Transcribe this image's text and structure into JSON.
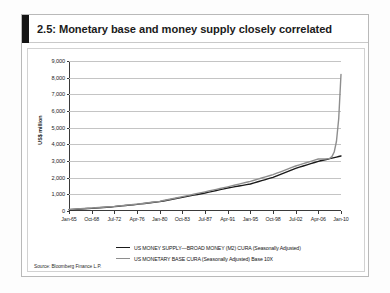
{
  "figure": {
    "number_and_title": "2.5: Monetary base and money supply closely correlated",
    "source_note": "Source: Bloomberg Finance L.P.",
    "accent_color": "#141414"
  },
  "chart_data": {
    "type": "line",
    "title": "2.5: Monetary base and money supply closely correlated",
    "xlabel": "",
    "ylabel": "US$ million",
    "ylim": [
      0,
      9000
    ],
    "ytick_step": 1000,
    "ytick_labels": [
      "0",
      "1,000",
      "2,000",
      "3,000",
      "4,000",
      "5,000",
      "6,000",
      "7,000",
      "8,000",
      "9,000"
    ],
    "grid": true,
    "legend_position": "bottom",
    "x_tick_labels": [
      "Jan-65",
      "Oct-68",
      "Jul-72",
      "Apr-76",
      "Jan-80",
      "Oct-83",
      "Jul-87",
      "Apr-91",
      "Jan-95",
      "Oct-98",
      "Jul-02",
      "Apr-06",
      "Jan-10"
    ],
    "series": [
      {
        "name": "US MONEY SUPPLY—BROAD MONEY (M2) CURA (Seasonally Adjusted)",
        "color": "#1a1a1a",
        "x": [
          "Jan-65",
          "Oct-68",
          "Jul-72",
          "Apr-76",
          "Jan-80",
          "Oct-83",
          "Jul-87",
          "Apr-91",
          "Jan-95",
          "Oct-98",
          "Jul-02",
          "Apr-06",
          "Jan-10"
        ],
        "values": [
          80,
          160,
          260,
          400,
          560,
          820,
          1080,
          1380,
          1620,
          2020,
          2560,
          2980,
          3300
        ]
      },
      {
        "name": "US MONETARY BASE CURA (Seasonally Adjusted) Base 10X",
        "color": "#8e8e8e",
        "x": [
          "Jan-65",
          "Oct-68",
          "Jul-72",
          "Apr-76",
          "Jan-80",
          "Oct-83",
          "Jul-87",
          "Apr-91",
          "Jan-95",
          "Oct-98",
          "Jul-02",
          "Apr-06",
          "Jan-10"
        ],
        "values": [
          95,
          175,
          275,
          410,
          580,
          860,
          1150,
          1450,
          1780,
          2180,
          2700,
          3120,
          8200
        ]
      }
    ],
    "annotations": [
      "Monetary base (10X) spikes from about 3,200 to about 8,200 after Apr-06"
    ]
  },
  "legend": {
    "entries": [
      {
        "label": "US MONEY SUPPLY—BROAD MONEY (M2) CURA (Seasonally Adjusted)",
        "color": "#1a1a1a"
      },
      {
        "label": "US MONETARY BASE CURA (Seasonally Adjusted) Base 10X",
        "color": "#8e8e8e"
      }
    ]
  }
}
